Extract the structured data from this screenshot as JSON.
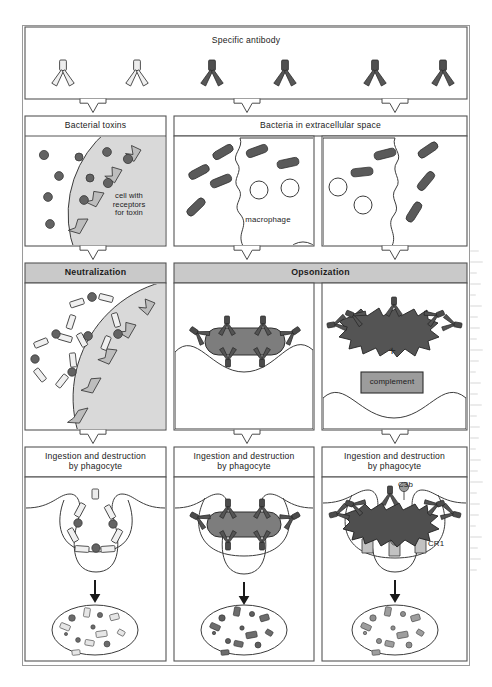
{
  "figure": {
    "title_row": {
      "label": "Specific antibody"
    },
    "rows": [
      {
        "id": "row-antibody",
        "panels": [
          {
            "id": "specific-antibody",
            "label": "Specific antibody",
            "span": 3
          }
        ]
      },
      {
        "id": "row-antigen",
        "panels": [
          {
            "id": "bacterial-toxins",
            "label": "Bacterial toxins",
            "span": 1
          },
          {
            "id": "bacteria-extracellular",
            "label": "Bacteria in extracellular space",
            "span": 2
          }
        ]
      },
      {
        "id": "row-mechanism",
        "panels": [
          {
            "id": "neutralization",
            "label": "Neutralization",
            "span": 1,
            "shaded": true
          },
          {
            "id": "opsonization",
            "label": "Opsonization",
            "span": 2,
            "shaded": true
          }
        ]
      },
      {
        "id": "row-ingestion",
        "panels": [
          {
            "id": "ingestion-1",
            "label": "Ingestion and destruction\nby phagocyte",
            "span": 1
          },
          {
            "id": "ingestion-2",
            "label": "Ingestion and destruction\nby phagocyte",
            "span": 1
          },
          {
            "id": "ingestion-3",
            "label": "Ingestion and destruction\nby phagocyte",
            "span": 1
          }
        ]
      }
    ],
    "inline_labels": {
      "cell_with_receptors": "cell  with\nreceptors\nfor toxin",
      "macrophage": "macrophage",
      "complement": "complement",
      "plus": "+",
      "c3b": "C3b",
      "cr1": "CR1"
    },
    "colors": {
      "antibody_light": "#ededed",
      "antibody_dark": "#555555",
      "toxin_dot": "#636363",
      "bacterium": "#5a5a5a",
      "bacterium_opsonized": "#7d7d7d",
      "cell_fill": "#d9d9d9",
      "header_shaded": "#c9c9c9",
      "complement_box": "#9c9c9c",
      "receptor_cr1": "#c2c2c2",
      "outline": "#3c3c3c",
      "panel_border": "#555555",
      "background": "#ffffff"
    },
    "counts": {
      "antibodies_light": 2,
      "antibodies_dark": 4,
      "toxin_dots": 9,
      "bacteria_panel2": 6,
      "bacteria_panel3": 5
    }
  }
}
